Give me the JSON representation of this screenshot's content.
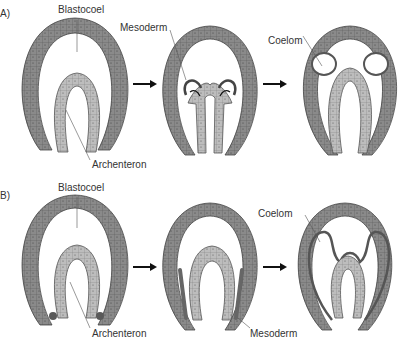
{
  "panels": {
    "A": {
      "label": "A)",
      "stage1": {
        "labels": {
          "blastocoel": "Blastocoel",
          "archenteron": "Archenteron"
        }
      },
      "stage2": {
        "labels": {
          "mesoderm": "Mesoderm"
        }
      },
      "stage3": {
        "labels": {
          "coelom": "Coelom"
        }
      }
    },
    "B": {
      "label": "B)",
      "stage1": {
        "labels": {
          "blastocoel": "Blastocoel",
          "archenteron": "Archenteron"
        }
      },
      "stage2": {
        "labels": {
          "mesoderm": "Mesoderm"
        }
      },
      "stage3": {
        "labels": {
          "coelom": "Coelom"
        }
      }
    }
  },
  "colors": {
    "ectoderm": "#8a8a8a",
    "endoderm": "#b8b8b8",
    "mesoderm": "#6e6e6e",
    "outline": "#444444",
    "arrow": "#111111"
  }
}
